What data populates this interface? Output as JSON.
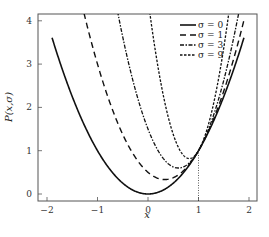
{
  "chart_data": {
    "type": "line",
    "title": "",
    "xlabel": "x",
    "ylabel": "P(x,σ)",
    "xlim": [
      -2.15,
      2.15
    ],
    "ylim": [
      -0.15,
      4.15
    ],
    "grid": false,
    "legend_position": "upper right",
    "x_ticks": [
      "-2",
      "-1",
      "0",
      "1",
      "2"
    ],
    "y_ticks": [
      "0",
      "1",
      "2",
      "3",
      "4"
    ],
    "formula": "P(x,σ) = x² + (σ/2)(x−1)²",
    "series": [
      {
        "name": "σ = 0",
        "sigma": 0,
        "style": "solid",
        "min_x": 0.0,
        "min_y": 0.0
      },
      {
        "name": "σ = 1",
        "sigma": 1,
        "style": "dashed",
        "min_x": 0.33,
        "min_y": 0.33
      },
      {
        "name": "σ = 3",
        "sigma": 3,
        "style": "dashdot",
        "min_x": 0.6,
        "min_y": 0.6
      },
      {
        "name": "σ = 9",
        "sigma": 9,
        "style": "dotted",
        "min_x": 0.82,
        "min_y": 0.82
      }
    ],
    "annotations": [
      {
        "type": "vertical-dotted-line",
        "x": 1,
        "from_y": 0,
        "to_y": 1,
        "note": "all curves meet at (1, 1)"
      }
    ]
  },
  "labels": {
    "x_axis": "x",
    "y_axis": "P(x,σ)",
    "legend": [
      "σ = 0",
      "σ = 1",
      "σ = 3",
      "σ = 9"
    ],
    "x_ticks": [
      "−2",
      "−1",
      "0",
      "1",
      "2"
    ],
    "y_ticks": [
      "0",
      "1",
      "2",
      "3",
      "4"
    ]
  }
}
